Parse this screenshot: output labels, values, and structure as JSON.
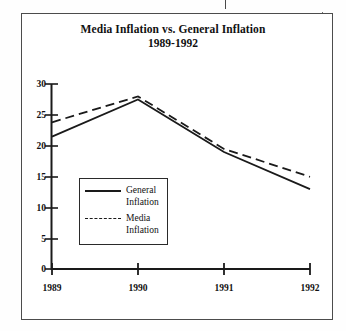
{
  "figure": {
    "title": "Media Inflation vs. General Inflation",
    "subtitle": "1989-1992"
  },
  "chart_data": {
    "type": "line",
    "title": "Media Inflation vs. General Inflation",
    "subtitle": "1989-1992",
    "xlabel": "",
    "ylabel": "",
    "categories": [
      "1989",
      "1990",
      "1991",
      "1992"
    ],
    "x": [
      1989,
      1990,
      1991,
      1992
    ],
    "series": [
      {
        "name": "General Inflation",
        "style": "solid",
        "color": "#1a1a1a",
        "values": [
          21.5,
          27.5,
          19.0,
          13.0
        ]
      },
      {
        "name": "Media Inflation",
        "style": "dashed",
        "color": "#1a1a1a",
        "values": [
          23.8,
          28.0,
          19.5,
          15.0
        ]
      }
    ],
    "ylim": [
      0,
      30
    ],
    "yticks": [
      0,
      5,
      10,
      15,
      20,
      25,
      30
    ],
    "ytick_labels": [
      "0",
      "5",
      "10",
      "15",
      "20",
      "25",
      "30"
    ],
    "xtick_labels": [
      "1989",
      "1990",
      "1991",
      "1992"
    ],
    "grid": false,
    "legend_position": "inside-lower-left"
  },
  "legend": {
    "items": [
      {
        "label": "General\nInflation",
        "style": "solid"
      },
      {
        "label": "Media\nInflation",
        "style": "dashed"
      }
    ]
  },
  "axis": {
    "y_ticks": [
      "30",
      "25",
      "20",
      "15",
      "10",
      "5",
      "0"
    ],
    "x_ticks": [
      "1989",
      "1990",
      "1991",
      "1992"
    ]
  },
  "colors": {
    "ink": "#1a1a1a",
    "frame": "#4c4c4c",
    "paper": "#ffffff"
  }
}
